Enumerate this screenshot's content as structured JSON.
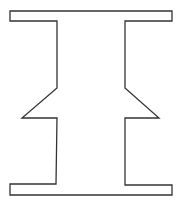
{
  "diagram": {
    "title": "",
    "shape": {
      "name": "i-beam-with-side-notches",
      "stroke_color": "#333333",
      "fill_color": "#ffffff",
      "stroke_width": 1.3,
      "points": [
        [
          10,
          11
        ],
        [
          172,
          11
        ],
        [
          172,
          21
        ],
        [
          125,
          21
        ],
        [
          125,
          88
        ],
        [
          159,
          118
        ],
        [
          125,
          118
        ],
        [
          125,
          185
        ],
        [
          172,
          185
        ],
        [
          172,
          195
        ],
        [
          10,
          195
        ],
        [
          10,
          184
        ],
        [
          56,
          184
        ],
        [
          57,
          118
        ],
        [
          22,
          118
        ],
        [
          57,
          88
        ],
        [
          57,
          21
        ],
        [
          10,
          21
        ]
      ]
    }
  }
}
